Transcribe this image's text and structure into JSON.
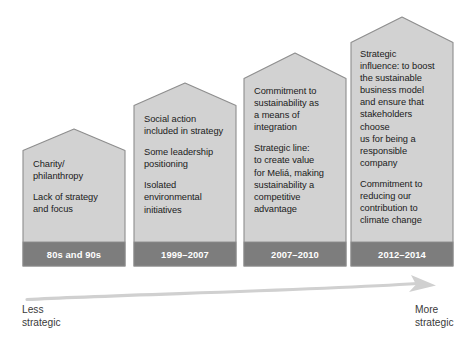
{
  "diagram": {
    "colors": {
      "body_fill": "#d2d2d2",
      "body_stroke": "#8d8d8d",
      "footer_fill": "#7d7d7d",
      "footer_text": "#ffffff",
      "body_text": "#1b1b1b",
      "arrow": "#cfcfcf",
      "axis_label_text": "#3a3a3a",
      "background": "#ffffff"
    },
    "steps": [
      {
        "id": "step-1",
        "period": "80s and 90s",
        "paragraphs": [
          "Charity/\nphilanthropy",
          "Lack of strategy\nand focus"
        ]
      },
      {
        "id": "step-2",
        "period": "1999–2007",
        "paragraphs": [
          "Social action\nincluded in strategy",
          "Some leadership\npositioning",
          "Isolated\nenvironmental\ninitiatives"
        ]
      },
      {
        "id": "step-3",
        "period": "2007–2010",
        "paragraphs": [
          "Commitment to\nsustainability as\na means of\nintegration",
          "Strategic line:\nto create value\nfor Meliá, making\nsustainability a\ncompetitive\nadvantage"
        ]
      },
      {
        "id": "step-4",
        "period": "2012–2014",
        "paragraphs": [
          "Strategic\ninfluence: to boost\nthe sustainable\nbusiness model\nand ensure that\nstakeholders choose\nus for being a\nresponsible\ncompany",
          "Commitment to\nreducing our\ncontribution to\nclimate change"
        ]
      }
    ],
    "axis": {
      "start_label": "Less\nstrategic",
      "end_label": "More\nstrategic"
    }
  }
}
